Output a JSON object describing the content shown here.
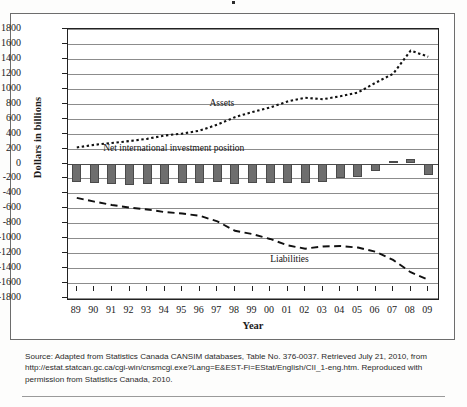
{
  "figure": {
    "title_clipped": "",
    "x_axis_label": "Year",
    "y_axis_label": "Dollars in billions"
  },
  "source": {
    "line1": "Source: Adapted from Statistics Canada CANSIM databases, Table No. 376-0037. Retrieved July 21, 2010, from",
    "line2": "http://estat.statcan.gc.ca/cgi-win/cnsmcgi.exe?Lang=E&EST-Fi=EStat/English/CII_1-eng.htm. Reproduced with",
    "line3": "permission from Statistics Canada, 2010."
  },
  "chart_data": {
    "type": "line",
    "title": "",
    "xlabel": "Year",
    "ylabel": "Dollars in billions",
    "ylim": [
      -1800,
      1800
    ],
    "ytick_step": 200,
    "yticks": [
      1800,
      1600,
      1400,
      1200,
      1000,
      800,
      600,
      400,
      200,
      0,
      -200,
      -400,
      -600,
      -800,
      -1000,
      -1200,
      -1400,
      -1600,
      -1800
    ],
    "grid": true,
    "legend_position": "inline-annotations",
    "categories": [
      "89",
      "90",
      "91",
      "92",
      "93",
      "94",
      "95",
      "96",
      "97",
      "98",
      "99",
      "00",
      "01",
      "02",
      "03",
      "04",
      "05",
      "06",
      "07",
      "08",
      "09"
    ],
    "series": [
      {
        "name": "Assets",
        "type": "line",
        "style": "dotted",
        "label_x_category": "99",
        "values": [
          215,
          250,
          275,
          300,
          330,
          375,
          400,
          440,
          520,
          620,
          690,
          750,
          830,
          880,
          860,
          900,
          950,
          1080,
          1200,
          1510,
          1430
        ]
      },
      {
        "name": "Net international investment position",
        "type": "bar",
        "style": "solid-fill",
        "label_x_category": "95",
        "values": [
          -245,
          -260,
          -275,
          -290,
          -280,
          -275,
          -265,
          -260,
          -250,
          -275,
          -255,
          -260,
          -265,
          -255,
          -250,
          -200,
          -175,
          -100,
          40,
          55,
          -150
        ]
      },
      {
        "name": "Liabilities",
        "type": "line",
        "style": "dashed",
        "label_x_category": "02",
        "values": [
          -460,
          -510,
          -555,
          -590,
          -615,
          -650,
          -670,
          -700,
          -775,
          -900,
          -945,
          -1010,
          -1095,
          -1140,
          -1110,
          -1105,
          -1125,
          -1180,
          -1290,
          -1455,
          -1555
        ]
      }
    ]
  }
}
